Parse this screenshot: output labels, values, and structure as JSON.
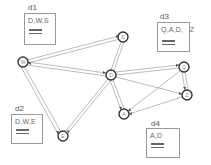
{
  "diagram": {
    "nodes": [
      {
        "id": "W",
        "label": "W",
        "x": 23,
        "y": 62
      },
      {
        "id": "S",
        "label": "S",
        "x": 123,
        "y": 37
      },
      {
        "id": "D",
        "label": "D",
        "x": 111,
        "y": 75
      },
      {
        "id": "Q",
        "label": "Q",
        "x": 184,
        "y": 67
      },
      {
        "id": "Z",
        "label": "Z",
        "x": 187,
        "y": 95
      },
      {
        "id": "A",
        "label": "A",
        "x": 124,
        "y": 114
      },
      {
        "id": "E",
        "label": "E",
        "x": 63,
        "y": 136
      }
    ],
    "edges": [
      [
        "W",
        "S"
      ],
      [
        "W",
        "D"
      ],
      [
        "W",
        "E"
      ],
      [
        "S",
        "D"
      ],
      [
        "D",
        "E"
      ],
      [
        "D",
        "A"
      ],
      [
        "D",
        "Q"
      ],
      [
        "D",
        "Z"
      ],
      [
        "Q",
        "Z"
      ],
      [
        "Q",
        "A"
      ],
      [
        "Z",
        "A"
      ]
    ],
    "documents": [
      {
        "id": "d1",
        "label": "d1",
        "content": "D,W,S"
      },
      {
        "id": "d2",
        "label": "d2",
        "content": "D,W,E"
      },
      {
        "id": "d3",
        "label": "d3",
        "content": "Q,A,D,   Z"
      },
      {
        "id": "d4",
        "label": "d4",
        "content": "A,D"
      }
    ]
  }
}
